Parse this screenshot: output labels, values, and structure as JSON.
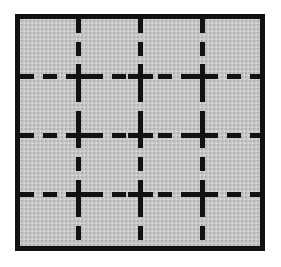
{
  "figure": {
    "canvas": {
      "width": 281,
      "height": 267,
      "background_color": "#ffffff"
    },
    "frame": {
      "name": "outer-square-frame",
      "left": 15,
      "top": 14,
      "width": 250,
      "height": 237,
      "border_width": 5,
      "border_color": "#121212",
      "fill_color": "#c8c8c8"
    },
    "grid": {
      "line_color": "#121212",
      "line_thickness": 5,
      "dash_length": 14,
      "dash_gap": 9,
      "columns": 4,
      "rows": 4,
      "vertical_line_x": [
        78,
        140,
        202
      ],
      "horizontal_line_y": [
        76,
        135,
        194
      ],
      "cross_arm_length": 25,
      "cross_count": 9
    }
  }
}
